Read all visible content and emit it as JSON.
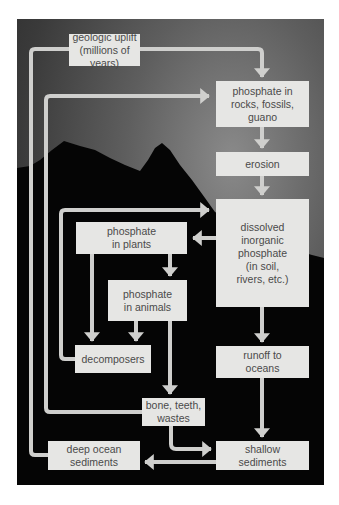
{
  "diagram": {
    "nodes": {
      "uplift": "geologic uplift\n(millions of years)",
      "rocks": "phosphate in\nrocks, fossils,\nguano",
      "erosion": "erosion",
      "dissolved": "dissolved\ninorganic\nphosphate\n(in soil,\nrivers, etc.)",
      "plants": "phosphate\nin plants",
      "animals": "phosphate\nin animals",
      "decomposers": "decomposers",
      "runoff": "runoff to\noceans",
      "bone": "bone, teeth,\nwastes",
      "deep": "deep ocean\nsediments",
      "shallow": "shallow\nsediments"
    },
    "edges": [
      {
        "from": "uplift",
        "to": "rocks"
      },
      {
        "from": "deep",
        "to": "uplift"
      },
      {
        "from": "bone",
        "to": "rocks"
      },
      {
        "from": "rocks",
        "to": "erosion"
      },
      {
        "from": "erosion",
        "to": "dissolved"
      },
      {
        "from": "decomposers",
        "to": "dissolved"
      },
      {
        "from": "dissolved",
        "to": "plants"
      },
      {
        "from": "plants",
        "to": "animals"
      },
      {
        "from": "plants",
        "to": "decomposers"
      },
      {
        "from": "animals",
        "to": "decomposers"
      },
      {
        "from": "animals",
        "to": "bone"
      },
      {
        "from": "dissolved",
        "to": "runoff"
      },
      {
        "from": "runoff",
        "to": "shallow"
      },
      {
        "from": "bone",
        "to": "shallow"
      },
      {
        "from": "shallow",
        "to": "deep"
      }
    ],
    "colors": {
      "box_fill": "#e6e6e4",
      "box_text": "#4a4a4a",
      "arrow": "#cfcfcd",
      "silhouette": "#050505"
    }
  }
}
